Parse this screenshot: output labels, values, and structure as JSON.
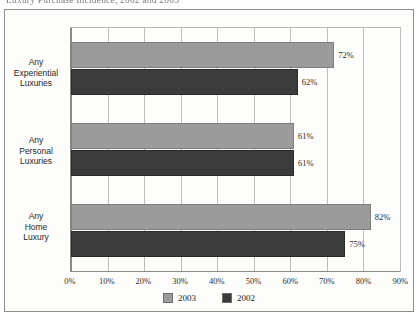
{
  "title": "Luxury Purchase Incidence, 2002 and 2003",
  "legend": {
    "items": [
      {
        "label": "2003",
        "color": "#9b9b9b",
        "swatch_name": "legend-swatch-2003"
      },
      {
        "label": "2002",
        "color": "#3b3b3b",
        "swatch_name": "legend-swatch-2002"
      }
    ]
  },
  "axis": {
    "ticks": [
      "0%",
      "10%",
      "20%",
      "30%",
      "40%",
      "50%",
      "60%",
      "70%",
      "80%",
      "90%"
    ]
  },
  "categories": [
    {
      "lines": [
        "Any",
        "Experiential",
        "Luxuries"
      ]
    },
    {
      "lines": [
        "Any",
        "Personal",
        "Luxuries"
      ]
    },
    {
      "lines": [
        "Any",
        "Home",
        "Luxury"
      ]
    }
  ],
  "bar_labels": {
    "experiential_2003": "72%",
    "experiential_2002": "62%",
    "personal_2003": "61%",
    "personal_2002": "61%",
    "home_2003": "82%",
    "home_2002": "75%"
  },
  "chart_data": {
    "type": "bar",
    "orientation": "horizontal",
    "title": "Luxury Purchase Incidence, 2002 and 2003",
    "xlabel": "",
    "ylabel": "",
    "xlim": [
      0,
      90
    ],
    "xticks": [
      0,
      10,
      20,
      30,
      40,
      50,
      60,
      70,
      80,
      90
    ],
    "xtick_labels": [
      "0%",
      "10%",
      "20%",
      "30%",
      "40%",
      "50%",
      "60%",
      "70%",
      "80%",
      "90%"
    ],
    "grid": true,
    "grid_axis": "x",
    "legend_position": "bottom-center",
    "value_labels": true,
    "value_label_suffix": "%",
    "categories": [
      "Any Experiential Luxuries",
      "Any Personal Luxuries",
      "Any Home Luxury"
    ],
    "series": [
      {
        "name": "2003",
        "color": "#9b9b9b",
        "values": [
          72,
          61,
          82
        ]
      },
      {
        "name": "2002",
        "color": "#3b3b3b",
        "values": [
          62,
          61,
          75
        ]
      }
    ]
  }
}
